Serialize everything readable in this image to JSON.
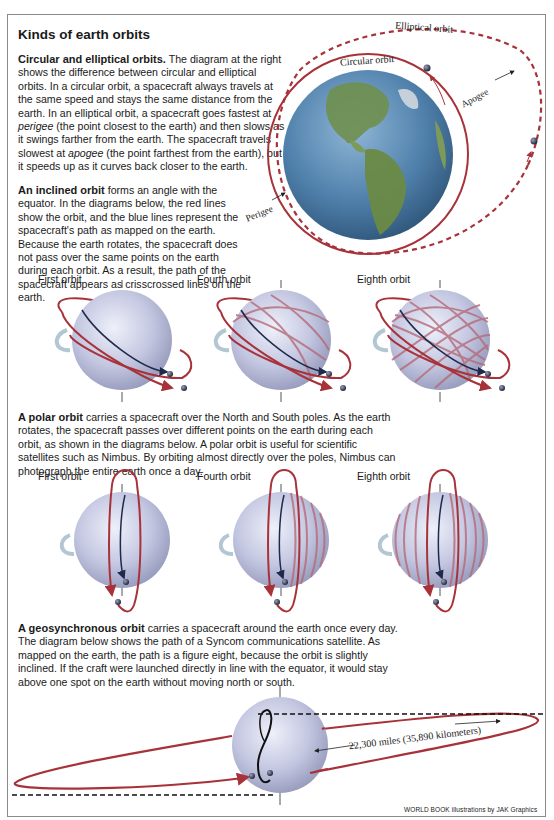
{
  "page": {
    "title": "Kinds of earth orbits",
    "credit": "WORLD BOOK illustrations by JAK Graphics"
  },
  "sections": {
    "circular_elliptical": {
      "heading": "Circular and elliptical orbits.",
      "text_1": " The diagram at the right shows the difference between circular and elliptical orbits. In a circular orbit, a spacecraft always travels at the same speed and stays the same distance from the earth. In an elliptical orbit, a spacecraft goes fastest at ",
      "term_1": "perigee",
      "text_2": " (the point closest to the earth) and then slows as it swings farther from the earth. The spacecraft travels slowest at ",
      "term_2": "apogee",
      "text_3": " (the point farthest from the earth), but it speeds up as it curves back closer to the earth.",
      "diagram_labels": {
        "elliptical": "Elliptical orbit",
        "circular": "Circular orbit",
        "apogee": "Apogee",
        "perigee": "Perigee"
      }
    },
    "inclined": {
      "heading": "An inclined orbit",
      "text": " forms an angle with the equator. In the diagrams below, the red lines show the orbit, and the blue lines represent the spacecraft's path as mapped on the earth. Because the earth rotates, the spacecraft does not pass over the same points on the earth during each orbit. As a result, the path of the spacecraft appears as crisscrossed lines on the earth.",
      "diagrams": [
        {
          "label": "First orbit"
        },
        {
          "label": "Fourth orbit"
        },
        {
          "label": "Eighth orbit"
        }
      ]
    },
    "polar": {
      "heading": "A polar orbit",
      "text": " carries a spacecraft over the North and South poles. As the earth rotates, the spacecraft passes over different points on the earth during each orbit, as shown in the diagrams below. A polar orbit is useful for scientific satellites such as Nimbus. By orbiting almost directly over the poles, Nimbus can photograph the entire earth once a day.",
      "diagrams": [
        {
          "label": "First orbit"
        },
        {
          "label": "Fourth orbit"
        },
        {
          "label": "Eighth orbit"
        }
      ]
    },
    "geosynchronous": {
      "heading": "A geosynchronous orbit",
      "text": " carries a spacecraft around the earth once every day. The diagram below shows the path of a Syncom communications satellite. As mapped on the earth, the path is a figure eight, because the orbit is slightly inclined. If the craft were launched directly in line with the equator, it would stay above one spot on the earth without moving north or south.",
      "distance_label": "22,300 miles (35,890 kilometers)"
    }
  },
  "colors": {
    "orbit_red": "#a8323a",
    "path_navy": "#1f2a4a",
    "track_line": "#b56a78",
    "sphere_light": "#dcdff0",
    "sphere_dark": "#9ea3c4",
    "earth_ocean": "#5b8fb8",
    "earth_land": "#6f8f4e",
    "frame": "#8a8a8a"
  }
}
